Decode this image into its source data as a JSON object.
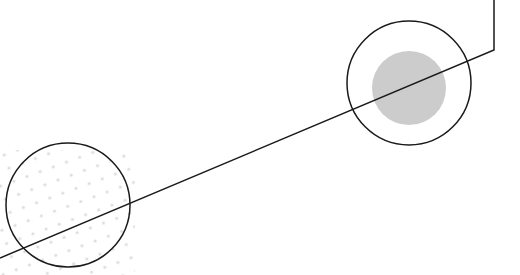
{
  "graphic": {
    "description": "Abstract decorative illustration: two outlined circles connected by a diagonal line, one with a gray filled disc, one with a dotted pattern",
    "colors": {
      "stroke": "#1a1a1a",
      "fill_gray": "#cccccc",
      "dots": "#d9d9d9",
      "background": "#ffffff"
    },
    "path_points": "494,0 494,50 0,258",
    "circle_right": {
      "cx": 409,
      "cy": 83,
      "r": 62
    },
    "disc_right": {
      "cx": 409,
      "cy": 88,
      "r": 37
    },
    "circle_left": {
      "cx": 68,
      "cy": 205,
      "r": 62
    }
  }
}
